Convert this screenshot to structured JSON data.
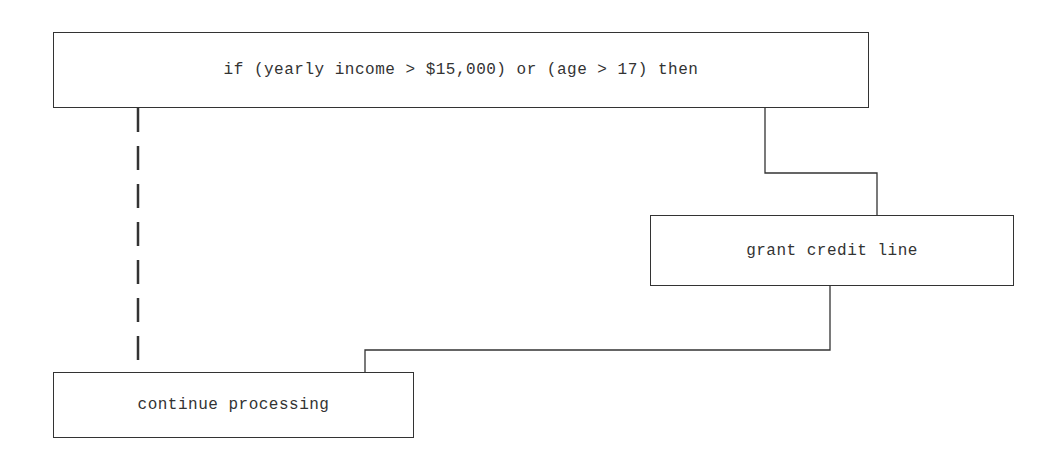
{
  "diagram": {
    "type": "flowchart",
    "nodes": [
      {
        "id": "condition",
        "label": "if (yearly income > $15,000) or (age > 17) then"
      },
      {
        "id": "grant",
        "label": "grant credit line"
      },
      {
        "id": "continue",
        "label": "continue processing"
      }
    ],
    "edges": [
      {
        "from": "condition",
        "to": "grant",
        "style": "solid",
        "meaning": "true"
      },
      {
        "from": "grant",
        "to": "continue",
        "style": "solid"
      },
      {
        "from": "condition",
        "to": "continue",
        "style": "dashed",
        "meaning": "false"
      }
    ],
    "colors": {
      "line": "#333333",
      "text": "#333333",
      "background": "#ffffff"
    }
  }
}
